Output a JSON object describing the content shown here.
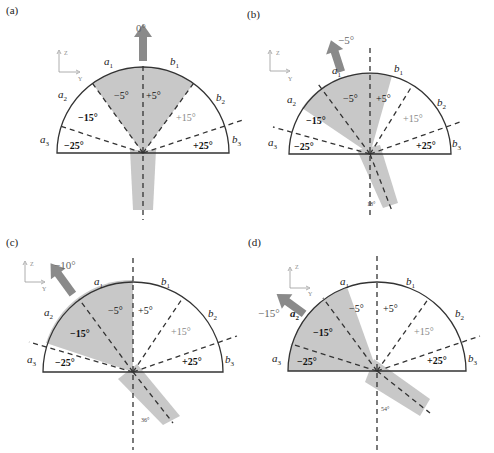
{
  "figure": {
    "panels": [
      {
        "id": "a",
        "label": "(a)",
        "arrow_label": "0°",
        "rotation_label": ""
      },
      {
        "id": "b",
        "label": "(b)",
        "arrow_label": "−5°",
        "rotation_label": "18°"
      },
      {
        "id": "c",
        "label": "(c)",
        "arrow_label": "−10°",
        "rotation_label": "36°"
      },
      {
        "id": "d",
        "label": "(d)",
        "arrow_label": "−15°",
        "rotation_label": "54°"
      }
    ],
    "sectors": {
      "m5": "−5°",
      "p5": "+5°",
      "m15": "−15°",
      "p15": "+15°",
      "m25": "−25°",
      "p25": "+25°"
    },
    "edges": {
      "a1": "a",
      "a2": "a",
      "a3": "a",
      "b1": "b",
      "b2": "b",
      "b3": "b",
      "sub1": "1",
      "sub2": "2",
      "sub3": "3"
    },
    "axes": {
      "z": "Z",
      "y": "Y"
    },
    "colors": {
      "shade": "#c8c8c8",
      "arrow": "#8a8a8a",
      "line": "#333333"
    }
  }
}
